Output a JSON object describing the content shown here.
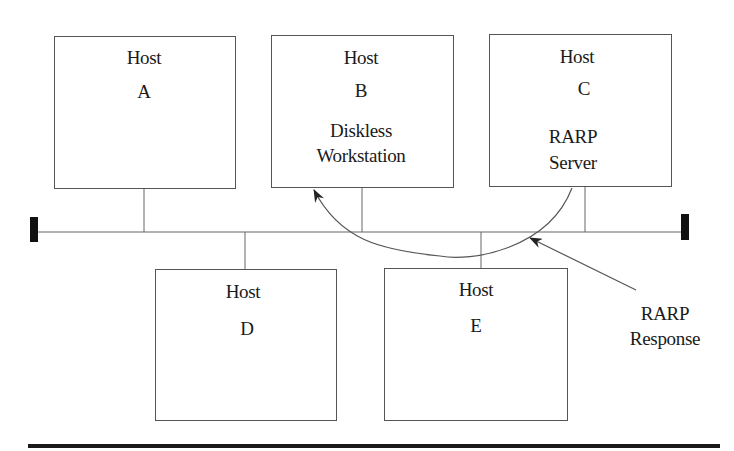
{
  "diagram": {
    "hosts": [
      {
        "id": "A",
        "label": "Host",
        "letter": "A",
        "role": ""
      },
      {
        "id": "B",
        "label": "Host",
        "letter": "B",
        "role_line1": "Diskless",
        "role_line2": "Workstation"
      },
      {
        "id": "C",
        "label": "Host",
        "letter": "C",
        "role_line1": "RARP",
        "role_line2": "Server"
      },
      {
        "id": "D",
        "label": "Host",
        "letter": "D",
        "role": ""
      },
      {
        "id": "E",
        "label": "Host",
        "letter": "E",
        "role": ""
      }
    ],
    "network": {
      "type": "bus",
      "terminators": 2
    },
    "edges": [
      {
        "from": "C",
        "to": "B",
        "label": "RARP Response",
        "style": "curved-arrow"
      }
    ],
    "annotation": {
      "line1": "RARP",
      "line2": "Response"
    },
    "colors": {
      "line": "#555555",
      "terminator": "#111111",
      "text": "#1a1a1a",
      "background": "#ffffff"
    }
  }
}
